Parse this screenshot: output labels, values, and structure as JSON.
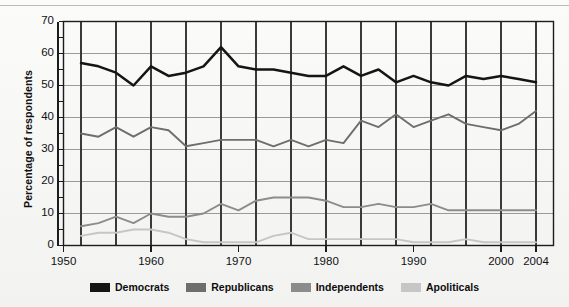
{
  "chart_data": {
    "type": "line",
    "title": "",
    "xlabel": "",
    "ylabel": "Percentage of respondents",
    "xlim": [
      1950,
      2006
    ],
    "ylim": [
      0,
      70
    ],
    "grid": true,
    "grid_x_step": 4,
    "grid_y_step": 10,
    "legend_position": "bottom",
    "ytick_labels": [
      "0",
      "10",
      "20",
      "30",
      "40",
      "50",
      "60",
      "70"
    ],
    "ytick_values": [
      0,
      10,
      20,
      30,
      40,
      50,
      60,
      70
    ],
    "yminor_step": 5,
    "xtick_labels": [
      "1950",
      "1960",
      "1970",
      "1980",
      "1990",
      "2000",
      "2004"
    ],
    "xtick_values": [
      1950,
      1960,
      1970,
      1980,
      1990,
      2000,
      2004
    ],
    "x": [
      1952,
      1954,
      1956,
      1958,
      1960,
      1962,
      1964,
      1966,
      1968,
      1970,
      1972,
      1974,
      1976,
      1978,
      1980,
      1982,
      1984,
      1986,
      1988,
      1990,
      1992,
      1994,
      1996,
      1998,
      2000,
      2002,
      2004
    ],
    "series": [
      {
        "name": "Democrats",
        "color": "#151515",
        "values": [
          57,
          56,
          54,
          50,
          56,
          53,
          54,
          56,
          62,
          56,
          55,
          55,
          54,
          53,
          53,
          56,
          53,
          55,
          51,
          53,
          51,
          50,
          53,
          52,
          53,
          52,
          51
        ]
      },
      {
        "name": "Republicans",
        "color": "#6e6e6e",
        "values": [
          35,
          34,
          37,
          34,
          37,
          36,
          31,
          32,
          33,
          33,
          33,
          31,
          33,
          31,
          33,
          32,
          39,
          37,
          41,
          37,
          39,
          41,
          38,
          37,
          36,
          38,
          42
        ]
      },
      {
        "name": "Independents",
        "color": "#8c8c8c",
        "values": [
          6,
          7,
          9,
          7,
          10,
          9,
          9,
          10,
          13,
          11,
          14,
          15,
          15,
          15,
          14,
          12,
          12,
          13,
          12,
          12,
          13,
          11,
          11,
          11,
          11,
          11,
          11
        ]
      },
      {
        "name": "Apoliticals",
        "color": "#c6c6c6",
        "values": [
          3,
          4,
          4,
          5,
          5,
          4,
          2,
          1,
          1,
          1,
          1,
          3,
          4,
          2,
          2,
          2,
          2,
          2,
          2,
          1,
          1,
          1,
          2,
          1,
          1,
          1,
          1
        ]
      }
    ]
  },
  "legend": {
    "items": [
      {
        "label": "Democrats",
        "color": "#151515"
      },
      {
        "label": "Republicans",
        "color": "#6e6e6e"
      },
      {
        "label": "Independents",
        "color": "#8c8c8c"
      },
      {
        "label": "Apoliticals",
        "color": "#c6c6c6"
      }
    ]
  },
  "axes": {
    "y_title": "Percentage of respondents"
  }
}
